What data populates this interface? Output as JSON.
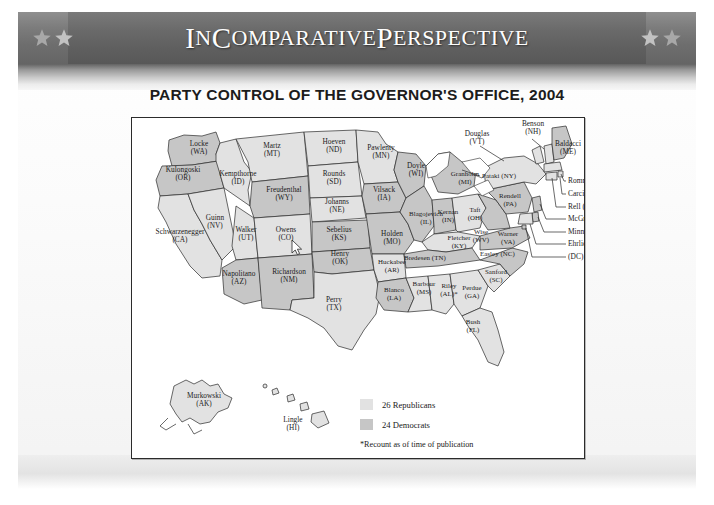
{
  "banner": {
    "title_parts": [
      {
        "text": "I",
        "style": "cap"
      },
      {
        "text": "N",
        "style": "sc"
      },
      {
        "text": " C",
        "style": "cap"
      },
      {
        "text": "OMPARATIVE",
        "style": "sc"
      },
      {
        "text": " P",
        "style": "cap"
      },
      {
        "text": "ERSPECTIVE",
        "style": "sc"
      }
    ],
    "title_plain": "IN COMPARATIVE PERSPECTIVE",
    "star_icon": "star-icon",
    "star_count_left": 2,
    "star_count_right": 2
  },
  "figure": {
    "title": "PARTY CONTROL OF THE GOVERNOR'S OFFICE, 2004"
  },
  "legend": {
    "items": [
      {
        "label": "26 Republicans",
        "color": "#e2e2e2",
        "party": "republican"
      },
      {
        "label": "24 Democrats",
        "color": "#c6c6c6",
        "party": "democrat"
      }
    ],
    "footnote": "*Recount as of time of publication"
  },
  "chart_data": {
    "type": "map",
    "title": "PARTY CONTROL OF THE GOVERNOR'S OFFICE, 2004",
    "region": "United States",
    "legend_position": "bottom-right",
    "categories": [
      "Republican",
      "Democrat"
    ],
    "values": [
      26,
      24
    ],
    "colors": {
      "republican": "#e2e2e2",
      "democrat": "#c6c6c6"
    },
    "annotations": [
      "*Recount as of time of publication"
    ],
    "states": [
      {
        "name": "Locke",
        "abbr": "WA",
        "party": "democrat"
      },
      {
        "name": "Kulongoski",
        "abbr": "OR",
        "party": "democrat"
      },
      {
        "name": "Schwarzenegger",
        "abbr": "CA",
        "party": "republican"
      },
      {
        "name": "Guinn",
        "abbr": "NV",
        "party": "republican"
      },
      {
        "name": "Kempthorne",
        "abbr": "ID",
        "party": "republican"
      },
      {
        "name": "Martz",
        "abbr": "MT",
        "party": "republican"
      },
      {
        "name": "Freudenthal",
        "abbr": "WY",
        "party": "democrat"
      },
      {
        "name": "Walker",
        "abbr": "UT",
        "party": "republican"
      },
      {
        "name": "Owens",
        "abbr": "CO",
        "party": "republican"
      },
      {
        "name": "Napolitano",
        "abbr": "AZ",
        "party": "democrat"
      },
      {
        "name": "Richardson",
        "abbr": "NM",
        "party": "democrat"
      },
      {
        "name": "Hoeven",
        "abbr": "ND",
        "party": "republican"
      },
      {
        "name": "Rounds",
        "abbr": "SD",
        "party": "republican"
      },
      {
        "name": "Johanns",
        "abbr": "NE",
        "party": "republican"
      },
      {
        "name": "Sebelius",
        "abbr": "KS",
        "party": "democrat"
      },
      {
        "name": "Henry",
        "abbr": "OK",
        "party": "democrat"
      },
      {
        "name": "Perry",
        "abbr": "TX",
        "party": "republican"
      },
      {
        "name": "Pawlenty",
        "abbr": "MN",
        "party": "republican"
      },
      {
        "name": "Vilsack",
        "abbr": "IA",
        "party": "democrat"
      },
      {
        "name": "Holden",
        "abbr": "MO",
        "party": "democrat"
      },
      {
        "name": "Huckabee",
        "abbr": "AR",
        "party": "republican"
      },
      {
        "name": "Blanco",
        "abbr": "LA",
        "party": "democrat"
      },
      {
        "name": "Barbour",
        "abbr": "MS",
        "party": "republican"
      },
      {
        "name": "Riley",
        "abbr": "AL",
        "party": "republican",
        "note": "*"
      },
      {
        "name": "Doyle",
        "abbr": "WI",
        "party": "democrat"
      },
      {
        "name": "Blagojevich",
        "abbr": "IL",
        "party": "democrat"
      },
      {
        "name": "Kernan",
        "abbr": "IN",
        "party": "democrat"
      },
      {
        "name": "Granholm",
        "abbr": "MI",
        "party": "democrat"
      },
      {
        "name": "Taft",
        "abbr": "OH",
        "party": "republican"
      },
      {
        "name": "Fletcher",
        "abbr": "KY",
        "party": "republican"
      },
      {
        "name": "Bredesen",
        "abbr": "TN",
        "party": "democrat"
      },
      {
        "name": "Perdue",
        "abbr": "GA",
        "party": "republican"
      },
      {
        "name": "Sanford",
        "abbr": "SC",
        "party": "republican"
      },
      {
        "name": "Easley",
        "abbr": "NC",
        "party": "democrat"
      },
      {
        "name": "Warner",
        "abbr": "VA",
        "party": "democrat"
      },
      {
        "name": "Wise",
        "abbr": "WV",
        "party": "democrat"
      },
      {
        "name": "Rendell",
        "abbr": "PA",
        "party": "democrat"
      },
      {
        "name": "Pataki",
        "abbr": "NY",
        "party": "republican"
      },
      {
        "name": "Douglas",
        "abbr": "VT",
        "party": "republican"
      },
      {
        "name": "Benson",
        "abbr": "NH",
        "party": "republican"
      },
      {
        "name": "Baldacci",
        "abbr": "ME",
        "party": "democrat"
      },
      {
        "name": "Romney",
        "abbr": "MA",
        "party": "republican"
      },
      {
        "name": "Carcieri",
        "abbr": "RI",
        "party": "republican"
      },
      {
        "name": "Rell",
        "abbr": "CT",
        "party": "republican"
      },
      {
        "name": "McGreevey",
        "abbr": "NJ",
        "party": "democrat"
      },
      {
        "name": "Minner",
        "abbr": "DE",
        "party": "democrat"
      },
      {
        "name": "Ehrlich",
        "abbr": "MD",
        "party": "republican"
      },
      {
        "name": "",
        "abbr": "DC",
        "party": "democrat"
      },
      {
        "name": "Bush",
        "abbr": "FL",
        "party": "republican"
      },
      {
        "name": "Murkowski",
        "abbr": "AK",
        "party": "republican"
      },
      {
        "name": "Lingle",
        "abbr": "HI",
        "party": "republican"
      }
    ]
  },
  "map_labels": {
    "wa": "Locke\n(WA)",
    "or": "Kulongoski\n(OR)",
    "ca": "Schwarzenegger\n(CA)",
    "nv": "Guinn\n(NV)",
    "id": "Kempthorne\n(ID)",
    "mt": "Martz\n(MT)",
    "wy": "Freudenthal\n(WY)",
    "ut": "Walker\n(UT)",
    "co": "Owens\n(CO)",
    "az": "Napolitano\n(AZ)",
    "nm": "Richardson\n(NM)",
    "nd": "Hoeven\n(ND)",
    "sd": "Rounds\n(SD)",
    "ne": "Johanns\n(NE)",
    "ks": "Sebelius\n(KS)",
    "ok": "Henry\n(OK)",
    "tx": "Perry\n(TX)",
    "mn": "Pawlenty\n(MN)",
    "ia": "Vilsack\n(IA)",
    "mo": "Holden\n(MO)",
    "ar": "Huckabee\n(AR)",
    "la": "Blanco\n(LA)",
    "ms": "Barbour\n(MS)",
    "al": "Riley\n(AL)*",
    "wi": "Doyle\n(WI)",
    "il": "Blagojevich\n(IL)",
    "in": "Kernan\n(IN)",
    "mi": "Granholm\n(MI)",
    "oh": "Taft\n(OH)",
    "ky": "Fletcher\n(KY)",
    "tn": "Bredesen (TN)",
    "ga": "Perdue\n(GA)",
    "sc": "Sanford\n(SC)",
    "nc": "Easley (NC)",
    "va": "Warner\n(VA)",
    "wv": "Wise\n(WV)",
    "pa": "Rendell\n(PA)",
    "ny": "Pataki (NY)",
    "vt": "Douglas\n(VT)",
    "nh": "Benson\n(NH)",
    "me": "Baldacci\n(ME)",
    "ma": "Romney (MA)",
    "ri": "Carcieri (RI)",
    "ct": "Rell (CT)",
    "nj": "McGreevey (NJ)",
    "de": "Minner (DE)",
    "md": "Ehrlich (MD)",
    "dc": "(DC)",
    "fl": "Bush\n(FL)",
    "ak": "Murkowski\n(AK)",
    "hi": "Lingle\n(HI)"
  }
}
